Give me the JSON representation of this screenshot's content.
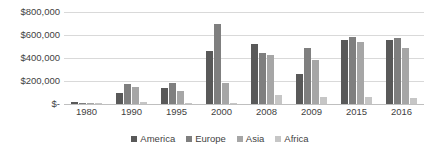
{
  "chart_data": {
    "type": "bar",
    "title": "",
    "xlabel": "",
    "ylabel": "",
    "ylim": [
      0,
      800000
    ],
    "grid": true,
    "legend_position": "bottom-center",
    "categories": [
      "1980",
      "1990",
      "1995",
      "2000",
      "2008",
      "2009",
      "2015",
      "2016"
    ],
    "ytick_labels": [
      "$800,000",
      "$600,000",
      "$400,000",
      "$200,000",
      "$-"
    ],
    "ytick_values": [
      800000,
      600000,
      400000,
      200000,
      0
    ],
    "series": [
      {
        "name": "America",
        "color": "#595959",
        "values": [
          18000,
          95000,
          140000,
          460000,
          520000,
          260000,
          560000,
          560000
        ]
      },
      {
        "name": "Europe",
        "color": "#7f7f7f",
        "values": [
          12000,
          170000,
          180000,
          700000,
          440000,
          490000,
          580000,
          570000
        ]
      },
      {
        "name": "Asia",
        "color": "#a6a6a6",
        "values": [
          4000,
          150000,
          110000,
          180000,
          430000,
          380000,
          540000,
          490000
        ]
      },
      {
        "name": "Africa",
        "color": "#c6c6c6",
        "values": [
          2000,
          20000,
          6000,
          5000,
          80000,
          60000,
          60000,
          50000
        ]
      }
    ]
  }
}
